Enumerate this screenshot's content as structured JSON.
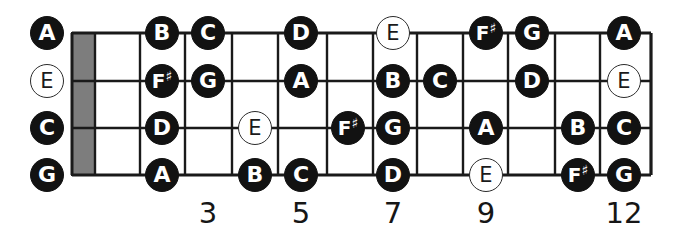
{
  "diagram": {
    "colors": {
      "background": "#ffffff",
      "fret_line": "#1a1a1a",
      "string_line": "#1a1a1a",
      "nut_fill": "#7d7d7d",
      "note_filled_bg": "#121212",
      "note_filled_text": "#ffffff",
      "note_hollow_bg": "#ffffff",
      "note_hollow_text": "#1a1a1a"
    },
    "geometry": {
      "width": 682,
      "height": 244,
      "board_left": 72,
      "board_right": 651,
      "string_y": [
        33,
        81,
        128,
        175
      ],
      "fret_x": [
        95,
        140,
        185,
        232,
        278,
        327,
        373,
        417,
        463,
        508,
        555,
        600,
        651
      ],
      "nut": {
        "x": 72,
        "y": 33,
        "width": 23,
        "height": 142
      }
    },
    "open_strings": [
      {
        "label": "A",
        "style": "filled",
        "x": 47,
        "y": 33,
        "string": 1
      },
      {
        "label": "E",
        "style": "hollow",
        "x": 47,
        "y": 81,
        "string": 2
      },
      {
        "label": "C",
        "style": "filled",
        "x": 47,
        "y": 128,
        "string": 3
      },
      {
        "label": "G",
        "style": "filled",
        "x": 47,
        "y": 175,
        "string": 4
      }
    ],
    "fret_numbers": [
      {
        "label": "3",
        "x": 208,
        "y": 199
      },
      {
        "label": "5",
        "x": 301,
        "y": 199
      },
      {
        "label": "7",
        "x": 393,
        "y": 199
      },
      {
        "label": "9",
        "x": 486,
        "y": 199
      },
      {
        "label": "12",
        "x": 624,
        "y": 199
      }
    ],
    "notes": [
      {
        "label": "B",
        "accidental": "",
        "style": "filled",
        "x": 162,
        "y": 33,
        "string": 1,
        "fret": 2
      },
      {
        "label": "C",
        "accidental": "",
        "style": "filled",
        "x": 208,
        "y": 33,
        "string": 1,
        "fret": 3
      },
      {
        "label": "D",
        "accidental": "",
        "style": "filled",
        "x": 301,
        "y": 33,
        "string": 1,
        "fret": 5
      },
      {
        "label": "E",
        "accidental": "",
        "style": "hollow",
        "x": 393,
        "y": 33,
        "string": 1,
        "fret": 7
      },
      {
        "label": "F",
        "accidental": "♯",
        "style": "filled",
        "x": 486,
        "y": 33,
        "string": 1,
        "fret": 9
      },
      {
        "label": "G",
        "accidental": "",
        "style": "filled",
        "x": 532,
        "y": 33,
        "string": 1,
        "fret": 10
      },
      {
        "label": "A",
        "accidental": "",
        "style": "filled",
        "x": 624,
        "y": 33,
        "string": 1,
        "fret": 12
      },
      {
        "label": "F",
        "accidental": "♯",
        "style": "filled",
        "x": 162,
        "y": 81,
        "string": 2,
        "fret": 2
      },
      {
        "label": "G",
        "accidental": "",
        "style": "filled",
        "x": 208,
        "y": 81,
        "string": 2,
        "fret": 3
      },
      {
        "label": "A",
        "accidental": "",
        "style": "filled",
        "x": 301,
        "y": 81,
        "string": 2,
        "fret": 5
      },
      {
        "label": "B",
        "accidental": "",
        "style": "filled",
        "x": 393,
        "y": 81,
        "string": 2,
        "fret": 7
      },
      {
        "label": "C",
        "accidental": "",
        "style": "filled",
        "x": 440,
        "y": 81,
        "string": 2,
        "fret": 8
      },
      {
        "label": "D",
        "accidental": "",
        "style": "filled",
        "x": 532,
        "y": 81,
        "string": 2,
        "fret": 10
      },
      {
        "label": "E",
        "accidental": "",
        "style": "hollow",
        "x": 624,
        "y": 81,
        "string": 2,
        "fret": 12
      },
      {
        "label": "D",
        "accidental": "",
        "style": "filled",
        "x": 162,
        "y": 128,
        "string": 3,
        "fret": 2
      },
      {
        "label": "E",
        "accidental": "",
        "style": "hollow",
        "x": 255,
        "y": 128,
        "string": 3,
        "fret": 4
      },
      {
        "label": "F",
        "accidental": "♯",
        "style": "filled",
        "x": 348,
        "y": 128,
        "string": 3,
        "fret": 6
      },
      {
        "label": "G",
        "accidental": "",
        "style": "filled",
        "x": 393,
        "y": 128,
        "string": 3,
        "fret": 7
      },
      {
        "label": "A",
        "accidental": "",
        "style": "filled",
        "x": 486,
        "y": 128,
        "string": 3,
        "fret": 9
      },
      {
        "label": "B",
        "accidental": "",
        "style": "filled",
        "x": 578,
        "y": 128,
        "string": 3,
        "fret": 11
      },
      {
        "label": "C",
        "accidental": "",
        "style": "filled",
        "x": 624,
        "y": 128,
        "string": 3,
        "fret": 12
      },
      {
        "label": "A",
        "accidental": "",
        "style": "filled",
        "x": 162,
        "y": 175,
        "string": 4,
        "fret": 2
      },
      {
        "label": "B",
        "accidental": "",
        "style": "filled",
        "x": 255,
        "y": 175,
        "string": 4,
        "fret": 4
      },
      {
        "label": "C",
        "accidental": "",
        "style": "filled",
        "x": 301,
        "y": 175,
        "string": 4,
        "fret": 5
      },
      {
        "label": "D",
        "accidental": "",
        "style": "filled",
        "x": 393,
        "y": 175,
        "string": 4,
        "fret": 7
      },
      {
        "label": "E",
        "accidental": "",
        "style": "hollow",
        "x": 486,
        "y": 175,
        "string": 4,
        "fret": 9
      },
      {
        "label": "F",
        "accidental": "♯",
        "style": "filled",
        "x": 578,
        "y": 175,
        "string": 4,
        "fret": 11
      },
      {
        "label": "G",
        "accidental": "",
        "style": "filled",
        "x": 624,
        "y": 175,
        "string": 4,
        "fret": 12
      }
    ]
  }
}
